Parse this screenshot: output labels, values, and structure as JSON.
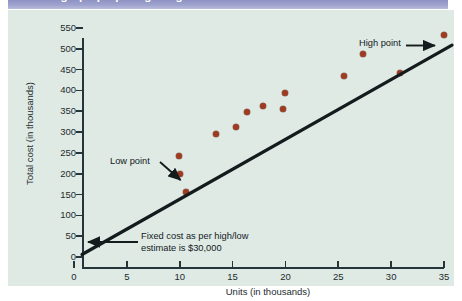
{
  "header": {
    "title": "Scattergraph preparing a high/low estimate"
  },
  "chart_data": {
    "type": "scatter",
    "title": "Scattergraph preparing a high/low estimate",
    "xlabel": "Units (in thousands)",
    "ylabel": "Total cost (in thousands)",
    "xlim": [
      0,
      35
    ],
    "ylim": [
      0,
      550
    ],
    "x_ticks": [
      0,
      5,
      10,
      15,
      20,
      25,
      30,
      35
    ],
    "y_ticks": [
      0,
      50,
      100,
      150,
      200,
      250,
      300,
      350,
      400,
      450,
      500,
      550
    ],
    "grid": false,
    "legend": "none",
    "point_color": "#9e3b21",
    "line_color": "#141b1c",
    "points": [
      {
        "x": 10.0,
        "y": 200,
        "label": "Low point"
      },
      {
        "x": 9.9,
        "y": 242,
        "label": ""
      },
      {
        "x": 10.6,
        "y": 155,
        "label": ""
      },
      {
        "x": 13.4,
        "y": 295,
        "label": ""
      },
      {
        "x": 15.3,
        "y": 313,
        "label": ""
      },
      {
        "x": 16.4,
        "y": 348,
        "label": ""
      },
      {
        "x": 17.9,
        "y": 362,
        "label": ""
      },
      {
        "x": 19.8,
        "y": 355,
        "label": ""
      },
      {
        "x": 20.0,
        "y": 395,
        "label": ""
      },
      {
        "x": 25.5,
        "y": 435,
        "label": ""
      },
      {
        "x": 27.3,
        "y": 487,
        "label": ""
      },
      {
        "x": 30.8,
        "y": 443,
        "label": ""
      },
      {
        "x": 35.0,
        "y": 533,
        "label": "High point"
      }
    ],
    "trend_line": {
      "x_start": 0.0,
      "y_start": 30,
      "x_end": 35.0,
      "y_end": 533
    },
    "annotations": [
      {
        "name": "high-point",
        "text": "High point",
        "arrow": "right"
      },
      {
        "name": "low-point",
        "text": "Low point",
        "arrow": "down-right"
      },
      {
        "name": "fixed-cost",
        "text": "Fixed cost as per high/low estimate is $30,000",
        "arrow": "left"
      }
    ]
  },
  "annotations": {
    "high_point": "High point",
    "low_point": "Low point",
    "fixed_cost_line1": "Fixed cost as per high/low",
    "fixed_cost_line2": "estimate is $30,000"
  }
}
